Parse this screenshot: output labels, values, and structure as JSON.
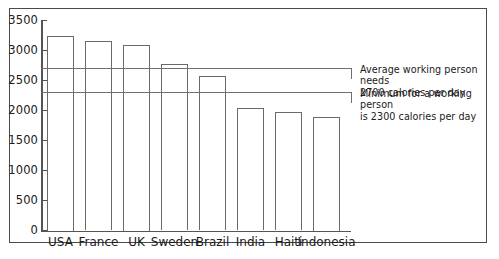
{
  "chart_data": {
    "type": "bar",
    "title": "",
    "subtitle": "",
    "xlabel": "",
    "ylabel": "",
    "ylim": [
      0,
      3500
    ],
    "yticks": [
      0,
      500,
      1000,
      1500,
      2000,
      2500,
      3000,
      3500
    ],
    "ytick_labels": [
      "0",
      "500",
      "1000",
      "1500",
      "2000",
      "2500",
      "3000",
      "3500"
    ],
    "grid": false,
    "legend_position": "none",
    "categories": [
      "USA",
      "France",
      "UK",
      "Sweden",
      "Brazil",
      "India",
      "Haiti",
      "Indonesia"
    ],
    "values": [
      3250,
      3160,
      3100,
      2780,
      2570,
      2040,
      1980,
      1900
    ],
    "bar_style": "outline",
    "reference_lines": [
      {
        "value": 2700,
        "label": "Average working person needs\n2700 calories per day"
      },
      {
        "value": 2300,
        "label": "Minimum for a working person\nis 2300  calories per day"
      }
    ],
    "colors": {
      "bar_outline": "#6a6a6a",
      "axis": "#555555",
      "reference_line": "#6f6f6f",
      "text": "#1a1a1a",
      "frame": "#4a4a4a",
      "background": "#ffffff"
    }
  }
}
